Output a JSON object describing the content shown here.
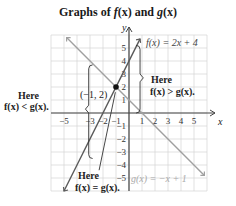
{
  "chart_data": {
    "type": "line",
    "title": "Graphs of f(x) and g(x)",
    "xlabel": "x",
    "ylabel": "y",
    "xlim": [
      -6,
      6
    ],
    "ylim": [
      -6,
      6
    ],
    "grid": true,
    "x_ticks": [
      -5,
      -3,
      -2,
      -1,
      1,
      2,
      3,
      4,
      5
    ],
    "y_ticks": [
      5,
      4,
      3,
      2,
      1,
      -1,
      -2,
      -3,
      -4,
      -5
    ],
    "series": [
      {
        "name": "f(x) = 2x + 4",
        "equation": "2x + 4",
        "slope": 2,
        "intercept": 4,
        "color": "#5a5a5a"
      },
      {
        "name": "g(x) = -x + 1",
        "equation": "-x + 1",
        "slope": -1,
        "intercept": 1,
        "color": "#9a9a9a"
      }
    ],
    "intersection": {
      "x": -1,
      "y": 2,
      "label": "(−1, 2)"
    },
    "annotations": [
      {
        "text_line1": "Here",
        "text_line2": "f(x) < g(x).",
        "region": "x < -1"
      },
      {
        "text_line1": "Here",
        "text_line2": "f(x) > g(x).",
        "region": "x > -1"
      },
      {
        "text_line1": "Here",
        "text_line2": "f(x) = g(x).",
        "region": "x = -1"
      }
    ]
  },
  "title": {
    "prefix": "Graphs of ",
    "f": "f",
    "fx": "(x)",
    "and": " and ",
    "g": "g",
    "gx": "(x)"
  },
  "labels": {
    "f_eq": "f(x) = 2x + 4",
    "g_eq": "g(x) = −x + 1",
    "point": "(−1, 2)",
    "here": "Here",
    "less": "f(x) < g(x).",
    "greater": "f(x) > g(x).",
    "equal": "f(x) = g(x).",
    "x_axis": "x",
    "y_axis": "y"
  },
  "colors": {
    "f_line": "#5a5a5a",
    "g_line": "#a0a0a0",
    "grid": "#d4d4d4",
    "axis": "#444444"
  }
}
